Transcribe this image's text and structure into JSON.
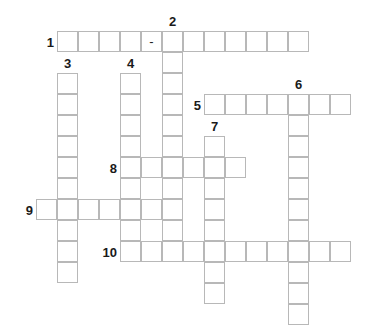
{
  "puzzle": {
    "title": "Crossword Grid",
    "cell_size": 21,
    "origin_x": 36,
    "origin_y": 31,
    "grid_cols": 15,
    "grid_rows": 14,
    "colors": {
      "cell_border": "#b8b8b8",
      "cell_fill": "#ffffff",
      "number_text": "#1a1a1a",
      "page_background": "#ffffff"
    },
    "entries": [
      {
        "number": "1",
        "direction": "across",
        "row": 0,
        "col": 1,
        "length": 12,
        "label_position": "left",
        "cells": [
          "",
          "",
          "",
          "",
          "-",
          "",
          "",
          "",
          "",
          "",
          "",
          ""
        ]
      },
      {
        "number": "2",
        "direction": "down",
        "row": 0,
        "col": 6,
        "length": 10,
        "label_position": "top",
        "cells": [
          "",
          "",
          "",
          "",
          "",
          "",
          "",
          "",
          "",
          ""
        ]
      },
      {
        "number": "3",
        "direction": "down",
        "row": 2,
        "col": 1,
        "length": 10,
        "label_position": "top",
        "cells": [
          "",
          "",
          "",
          "",
          "",
          "",
          "",
          "",
          "",
          ""
        ]
      },
      {
        "number": "4",
        "direction": "down",
        "row": 2,
        "col": 4,
        "length": 8,
        "label_position": "top",
        "cells": [
          "",
          "",
          "",
          "",
          "",
          "",
          "",
          ""
        ]
      },
      {
        "number": "5",
        "direction": "across",
        "row": 3,
        "col": 8,
        "length": 7,
        "label_position": "left",
        "cells": [
          "",
          "",
          "",
          "",
          "",
          "",
          ""
        ]
      },
      {
        "number": "6",
        "direction": "down",
        "row": 3,
        "col": 12,
        "length": 11,
        "label_position": "top",
        "cells": [
          "",
          "",
          "",
          "",
          "",
          "",
          "",
          "",
          "",
          "",
          ""
        ]
      },
      {
        "number": "7",
        "direction": "down",
        "row": 5,
        "col": 8,
        "length": 8,
        "label_position": "top",
        "cells": [
          "",
          "",
          "",
          "",
          "",
          "",
          "",
          ""
        ]
      },
      {
        "number": "8",
        "direction": "across",
        "row": 6,
        "col": 4,
        "length": 6,
        "label_position": "left",
        "cells": [
          "",
          "",
          "",
          "",
          "",
          ""
        ]
      },
      {
        "number": "9",
        "direction": "across",
        "row": 8,
        "col": 0,
        "length": 7,
        "label_position": "left",
        "cells": [
          "",
          "",
          "",
          "",
          "",
          "",
          ""
        ]
      },
      {
        "number": "10",
        "direction": "across",
        "row": 10,
        "col": 4,
        "length": 11,
        "label_position": "left",
        "cells": [
          "",
          "",
          "",
          "",
          "",
          "",
          "",
          "",
          "",
          "",
          ""
        ]
      }
    ]
  }
}
